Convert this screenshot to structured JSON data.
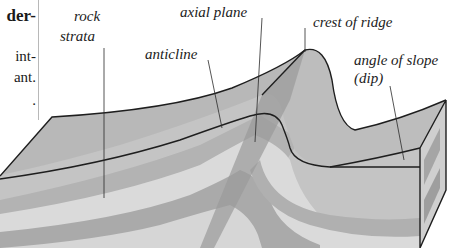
{
  "page_text": {
    "heading_fragment": "der-",
    "body_fragments": [
      "int-",
      "ant.",
      "."
    ]
  },
  "diagram": {
    "labels": {
      "rock_strata_line1": "rock",
      "rock_strata_line2": "strata",
      "axial_plane": "axial plane",
      "anticline": "anticline",
      "crest_of_ridge": "crest of ridge",
      "angle_of_slope_line1": "angle of slope",
      "angle_of_slope_line2": "(dip)"
    },
    "colors": {
      "dark_stratum": "#a9a9a9",
      "mid_stratum": "#bdbdbd",
      "light_stratum": "#dcdcdc",
      "surface": "#c4c4c4",
      "outline": "#1e1e1e"
    }
  }
}
